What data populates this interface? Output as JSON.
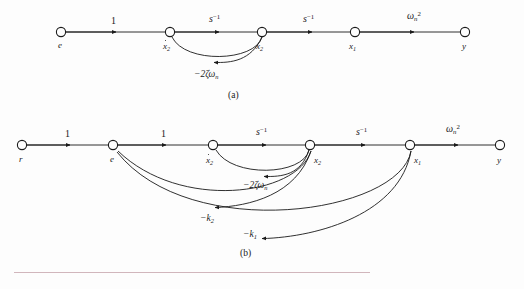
{
  "figure": {
    "type": "signal-flow-graph",
    "panels": [
      {
        "id": "a",
        "caption": "(a)",
        "caption_x": 228,
        "caption_y": 91,
        "baseline_y": 32,
        "nodes": [
          {
            "id": "n_e",
            "label": "e",
            "label_html": "e",
            "x": 61,
            "y": 32,
            "lx": 58,
            "ly": 41
          },
          {
            "id": "n_x2d",
            "label": "x2dot",
            "label_html": "<span class=\"dotover\">x</span><span class=\"sub\">2</span>",
            "x": 170,
            "y": 32,
            "lx": 163,
            "ly": 42
          },
          {
            "id": "n_x2",
            "label": "x2",
            "label_html": "x<span class=\"sub\">2</span>",
            "x": 262,
            "y": 32,
            "lx": 256,
            "ly": 42
          },
          {
            "id": "n_x1",
            "label": "x1",
            "label_html": "x<span class=\"sub\">1</span>",
            "x": 355,
            "y": 32,
            "lx": 349,
            "ly": 42
          },
          {
            "id": "n_y",
            "label": "y",
            "label_html": "y",
            "x": 465,
            "y": 32,
            "lx": 462,
            "ly": 42
          }
        ],
        "edges": [
          {
            "from": "n_e",
            "to": "n_x2d",
            "gain": "1",
            "gain_html": "<span class=\"num\">1</span>",
            "lx": 111,
            "ly": 16,
            "kind": "straight"
          },
          {
            "from": "n_x2d",
            "to": "n_x2",
            "gain": "s^-1",
            "gain_html": "s<span class=\"sup\">&#8722;1</span>",
            "lx": 209,
            "ly": 14,
            "kind": "straight"
          },
          {
            "from": "n_x2",
            "to": "n_x1",
            "gain": "s^-1",
            "gain_html": "s<span class=\"sup\">&#8722;1</span>",
            "lx": 303,
            "ly": 14,
            "kind": "straight"
          },
          {
            "from": "n_x1",
            "to": "n_y",
            "gain": "wn^2",
            "gain_html": "&#969;<span class=\"subn\">n</span><span class=\"sup\">2</span>",
            "lx": 407,
            "ly": 11,
            "kind": "straight"
          },
          {
            "from": "n_x2",
            "to": "n_x2d",
            "gain": "-2*zeta*wn",
            "gain_html": "&#8722;2&#950;&#969;<span class=\"subn\">n</span>",
            "lx": 194,
            "ly": 70,
            "kind": "curve-below"
          }
        ]
      },
      {
        "id": "b",
        "caption": "(b)",
        "caption_x": 240,
        "caption_y": 249,
        "baseline_y": 145,
        "nodes": [
          {
            "id": "m_r",
            "label": "r",
            "label_html": "r",
            "x": 22,
            "y": 145,
            "lx": 19,
            "ly": 155
          },
          {
            "id": "m_e",
            "label": "e",
            "label_html": "e",
            "x": 113,
            "y": 145,
            "lx": 110,
            "ly": 155
          },
          {
            "id": "m_x2d",
            "label": "x2dot",
            "label_html": "<span class=\"dotover\">x</span><span class=\"sub\">2</span>",
            "x": 213,
            "y": 145,
            "lx": 206,
            "ly": 156
          },
          {
            "id": "m_x2",
            "label": "x2",
            "label_html": "x<span class=\"sub\">2</span>",
            "x": 310,
            "y": 145,
            "lx": 314,
            "ly": 156
          },
          {
            "id": "m_x1",
            "label": "x1",
            "label_html": "x<span class=\"sub\">1</span>",
            "x": 410,
            "y": 145,
            "lx": 414,
            "ly": 156
          },
          {
            "id": "m_y",
            "label": "y",
            "label_html": "y",
            "x": 500,
            "y": 145,
            "lx": 497,
            "ly": 156
          }
        ],
        "edges": [
          {
            "from": "m_r",
            "to": "m_e",
            "gain": "1",
            "gain_html": "<span class=\"num\">1</span>",
            "lx": 65,
            "ly": 129,
            "kind": "straight"
          },
          {
            "from": "m_e",
            "to": "m_x2d",
            "gain": "1",
            "gain_html": "<span class=\"num\">1</span>",
            "lx": 161,
            "ly": 129,
            "kind": "straight"
          },
          {
            "from": "m_x2d",
            "to": "m_x2",
            "gain": "s^-1",
            "gain_html": "s<span class=\"sup\">&#8722;1</span>",
            "lx": 256,
            "ly": 127,
            "kind": "straight"
          },
          {
            "from": "m_x2",
            "to": "m_x1",
            "gain": "s^-1",
            "gain_html": "s<span class=\"sup\">&#8722;1</span>",
            "lx": 356,
            "ly": 127,
            "kind": "straight"
          },
          {
            "from": "m_x1",
            "to": "m_y",
            "gain": "wn^2",
            "gain_html": "&#969;<span class=\"subn\">n</span><span class=\"sup\">2</span>",
            "lx": 446,
            "ly": 124,
            "kind": "straight"
          },
          {
            "from": "m_x2",
            "to": "m_x2d",
            "gain": "-2*zeta*wn",
            "gain_html": "&#8722;2&#950;&#969;<span class=\"subn\">n</span>",
            "lx": 243,
            "ly": 181,
            "kind": "curve-below"
          },
          {
            "from": "m_x2",
            "to": "m_e",
            "gain": "-k2",
            "gain_html": "&#8722;k<span class=\"sub\">2</span>",
            "lx": 200,
            "ly": 214,
            "kind": "curve-below"
          },
          {
            "from": "m_x1",
            "to": "m_e",
            "gain": "-k1",
            "gain_html": "&#8722;k<span class=\"sub\">1</span>",
            "lx": 243,
            "ly": 230,
            "kind": "curve-below"
          }
        ]
      }
    ],
    "footer_rule": {
      "x": 14,
      "y": 272,
      "width": 356,
      "color": "#c9a9b0"
    },
    "colors": {
      "stroke": "#1a1a1a",
      "background": "#fdfdfd",
      "rule": "#c9a9b0"
    }
  }
}
